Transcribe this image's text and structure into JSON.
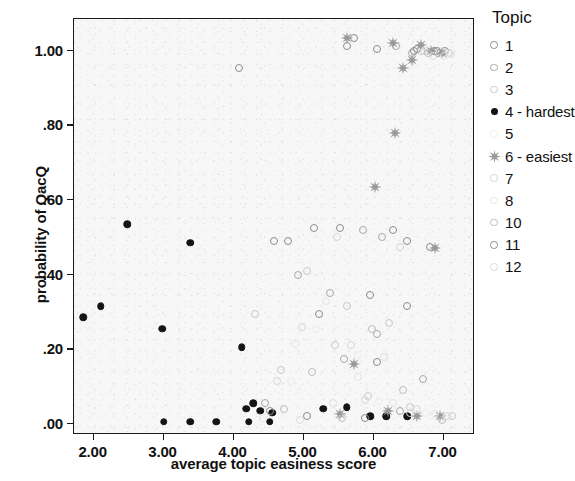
{
  "chart_data": {
    "type": "scatter",
    "title": "",
    "xlabel": "average topic easiness score",
    "ylabel": "probability of QacQ",
    "xlim": [
      1.72,
      7.45
    ],
    "ylim": [
      -0.03,
      1.085
    ],
    "xticks": [
      "2.00",
      "3.00",
      "4.00",
      "5.00",
      "6.00",
      "7.00"
    ],
    "xtick_values": [
      2.0,
      3.0,
      4.0,
      5.0,
      6.0,
      7.0
    ],
    "yticks": [
      ".00",
      ".20",
      ".40",
      ".60",
      ".80",
      "1.00"
    ],
    "ytick_values": [
      0.0,
      0.2,
      0.4,
      0.6,
      0.8,
      1.0
    ],
    "grid": false,
    "legend_position": "right",
    "legend_title": "Topic",
    "series": [
      {
        "name": "1",
        "label": "1",
        "marker": "circle",
        "color": "#8c8c8c",
        "points": [
          [
            5.72,
            1.035
          ],
          [
            5.62,
            1.012
          ],
          [
            6.05,
            1.005
          ],
          [
            6.62,
            1.005
          ],
          [
            6.86,
            1.0
          ],
          [
            7.02,
            1.0
          ],
          [
            4.08,
            0.955
          ],
          [
            5.52,
            0.525
          ],
          [
            6.28,
            0.52
          ],
          [
            6.8,
            0.475
          ],
          [
            5.95,
            0.345
          ],
          [
            6.48,
            0.315
          ],
          [
            5.22,
            0.295
          ],
          [
            4.58,
            0.49
          ],
          [
            4.78,
            0.49
          ]
        ]
      },
      {
        "name": "2",
        "label": "2",
        "marker": "circle",
        "color": "#a8a8a8",
        "points": [
          [
            6.32,
            1.012
          ],
          [
            6.55,
            0.995
          ],
          [
            6.92,
            0.995
          ],
          [
            5.85,
            0.52
          ],
          [
            6.12,
            0.5
          ],
          [
            4.92,
            0.4
          ],
          [
            5.38,
            0.35
          ],
          [
            6.05,
            0.24
          ],
          [
            5.58,
            0.175
          ],
          [
            6.7,
            0.12
          ],
          [
            4.45,
            0.055
          ],
          [
            6.38,
            0.035
          ]
        ]
      },
      {
        "name": "3",
        "label": "3",
        "marker": "circle",
        "color": "#c9c9c9",
        "points": [
          [
            6.68,
            1.0
          ],
          [
            7.08,
            0.995
          ],
          [
            5.05,
            0.41
          ],
          [
            5.62,
            0.315
          ],
          [
            4.3,
            0.295
          ],
          [
            6.22,
            0.27
          ],
          [
            5.45,
            0.21
          ],
          [
            4.68,
            0.145
          ],
          [
            5.92,
            0.075
          ],
          [
            6.52,
            0.045
          ],
          [
            7.12,
            0.02
          ]
        ]
      },
      {
        "name": "4 - hardest",
        "label": "4 - hardest",
        "marker": "filled-circle",
        "color": "#141414",
        "points": [
          [
            2.48,
            0.535
          ],
          [
            3.38,
            0.485
          ],
          [
            2.1,
            0.315
          ],
          [
            1.85,
            0.285
          ],
          [
            2.98,
            0.255
          ],
          [
            4.12,
            0.205
          ],
          [
            4.28,
            0.055
          ],
          [
            4.18,
            0.04
          ],
          [
            4.38,
            0.035
          ],
          [
            4.55,
            0.03
          ],
          [
            5.28,
            0.04
          ],
          [
            5.62,
            0.045
          ],
          [
            3.0,
            0.005
          ],
          [
            3.38,
            0.005
          ],
          [
            3.75,
            0.005
          ],
          [
            4.22,
            0.005
          ],
          [
            4.52,
            0.005
          ],
          [
            5.95,
            0.02
          ],
          [
            6.18,
            0.02
          ],
          [
            6.48,
            0.02
          ]
        ]
      },
      {
        "name": "5",
        "label": "5",
        "marker": "circle",
        "color": "#ededed",
        "points": [
          [
            6.95,
            1.0
          ],
          [
            7.05,
            0.99
          ],
          [
            5.18,
            0.255
          ],
          [
            5.78,
            0.185
          ],
          [
            4.82,
            0.115
          ],
          [
            6.08,
            0.06
          ],
          [
            6.75,
            0.03
          ],
          [
            7.02,
            0.015
          ]
        ]
      },
      {
        "name": "6 - easiest",
        "label": "6 - easiest",
        "marker": "star",
        "color": "#9a9a9a",
        "points": [
          [
            5.62,
            1.035
          ],
          [
            6.28,
            1.02
          ],
          [
            6.68,
            1.015
          ],
          [
            6.82,
            1.0
          ],
          [
            6.98,
            0.995
          ],
          [
            6.55,
            0.975
          ],
          [
            6.42,
            0.955
          ],
          [
            6.3,
            0.78
          ],
          [
            6.02,
            0.635
          ],
          [
            6.88,
            0.47
          ],
          [
            5.72,
            0.16
          ],
          [
            6.2,
            0.035
          ],
          [
            6.62,
            0.02
          ],
          [
            6.95,
            0.02
          ],
          [
            5.52,
            0.025
          ]
        ]
      },
      {
        "name": "7",
        "label": "7",
        "marker": "circle",
        "color": "#d6d6d6",
        "points": [
          [
            6.72,
            1.0
          ],
          [
            5.48,
            0.5
          ],
          [
            6.38,
            0.475
          ],
          [
            4.98,
            0.26
          ],
          [
            5.68,
            0.21
          ],
          [
            4.62,
            0.115
          ],
          [
            5.88,
            0.065
          ],
          [
            6.52,
            0.03
          ]
        ]
      },
      {
        "name": "8",
        "label": "8",
        "marker": "circle",
        "color": "#e4e4e4",
        "points": [
          [
            7.0,
            0.985
          ],
          [
            5.32,
            0.33
          ],
          [
            4.88,
            0.215
          ],
          [
            5.78,
            0.125
          ],
          [
            6.28,
            0.055
          ],
          [
            6.88,
            0.025
          ],
          [
            4.42,
            0.015
          ]
        ]
      },
      {
        "name": "10",
        "label": "10",
        "marker": "circle",
        "color": "#bdbdbd",
        "points": [
          [
            6.78,
            0.995
          ],
          [
            5.98,
            0.255
          ],
          [
            5.12,
            0.14
          ],
          [
            6.42,
            0.09
          ],
          [
            4.72,
            0.04
          ],
          [
            5.55,
            0.015
          ],
          [
            6.98,
            0.01
          ]
        ]
      },
      {
        "name": "11",
        "label": "11",
        "marker": "circle",
        "color": "#8c8c8c",
        "points": [
          [
            6.58,
            1.0
          ],
          [
            6.9,
            1.0
          ],
          [
            6.48,
            0.49
          ],
          [
            5.15,
            0.525
          ],
          [
            6.05,
            0.165
          ],
          [
            4.52,
            0.035
          ],
          [
            5.05,
            0.02
          ],
          [
            5.88,
            0.015
          ]
        ]
      },
      {
        "name": "12",
        "label": "12",
        "marker": "circle",
        "color": "#dcdcdc",
        "points": [
          [
            7.1,
            0.99
          ],
          [
            6.85,
            0.985
          ],
          [
            6.15,
            0.18
          ],
          [
            5.42,
            0.055
          ],
          [
            6.62,
            0.04
          ],
          [
            7.05,
            0.02
          ],
          [
            4.95,
            0.01
          ]
        ]
      }
    ]
  }
}
